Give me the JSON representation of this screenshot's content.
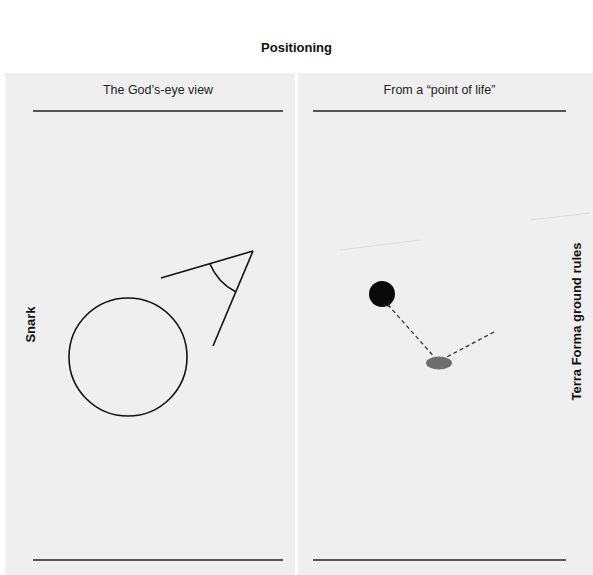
{
  "title": "Positioning",
  "columns": [
    {
      "title": "The God’s-eye view"
    },
    {
      "title": "From a “point of life”"
    }
  ],
  "side_labels": {
    "left": "Snark",
    "right": "Terra Forma ground rules"
  },
  "colors": {
    "panel_background": "#efefef",
    "stroke": "#111111",
    "ellipse_fill": "#6e6e6e"
  }
}
